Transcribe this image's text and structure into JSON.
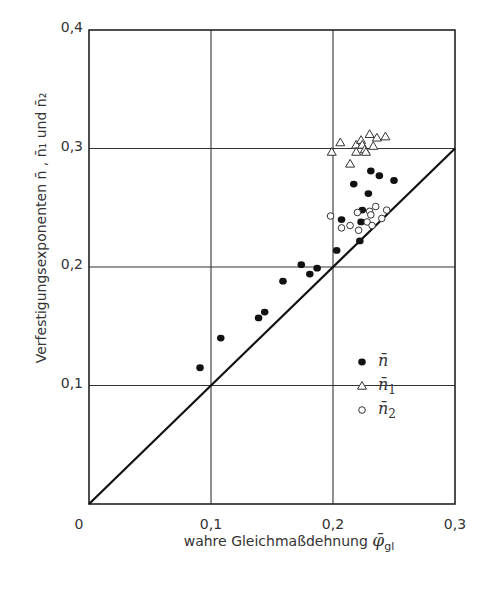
{
  "chart_data": {
    "type": "scatter",
    "title": "",
    "xlabel": "wahre Gleichmaßdehnung φ̄gl",
    "xlabel_main": "wahre Gleichmaßdehnung ",
    "xlabel_symbol": "φ̄",
    "xlabel_sub": "gl",
    "ylabel": "Verfestigungsexponenten n̄ , n̄₁ und n̄₂",
    "xlim": [
      0,
      0.3
    ],
    "ylim": [
      0,
      0.4
    ],
    "grid": true,
    "x_ticks": [
      "0",
      "0,1",
      "0,2",
      "0,3"
    ],
    "x_tick_values": [
      0,
      0.1,
      0.2,
      0.3
    ],
    "y_ticks": [
      "0,1",
      "0,2",
      "0,3",
      "0,4"
    ],
    "y_tick_values": [
      0.1,
      0.2,
      0.3,
      0.4
    ],
    "reference_line": {
      "label": "y = x",
      "from": [
        0,
        0
      ],
      "to": [
        0.3,
        0.3
      ]
    },
    "legend_position": "lower right inside",
    "series": [
      {
        "name": "n̄",
        "marker": "filled-circle",
        "points": [
          [
            0.091,
            0.115
          ],
          [
            0.108,
            0.14
          ],
          [
            0.139,
            0.157
          ],
          [
            0.144,
            0.162
          ],
          [
            0.159,
            0.188
          ],
          [
            0.174,
            0.202
          ],
          [
            0.181,
            0.194
          ],
          [
            0.187,
            0.199
          ],
          [
            0.203,
            0.214
          ],
          [
            0.207,
            0.24
          ],
          [
            0.217,
            0.27
          ],
          [
            0.222,
            0.222
          ],
          [
            0.223,
            0.238
          ],
          [
            0.224,
            0.248
          ],
          [
            0.229,
            0.262
          ],
          [
            0.231,
            0.281
          ],
          [
            0.238,
            0.277
          ],
          [
            0.25,
            0.273
          ]
        ]
      },
      {
        "name": "n̄₁",
        "marker": "open-triangle",
        "points": [
          [
            0.199,
            0.297
          ],
          [
            0.206,
            0.305
          ],
          [
            0.214,
            0.287
          ],
          [
            0.219,
            0.303
          ],
          [
            0.219,
            0.297
          ],
          [
            0.223,
            0.307
          ],
          [
            0.224,
            0.303
          ],
          [
            0.226,
            0.299
          ],
          [
            0.227,
            0.297
          ],
          [
            0.23,
            0.312
          ],
          [
            0.233,
            0.302
          ],
          [
            0.236,
            0.309
          ],
          [
            0.243,
            0.31
          ]
        ]
      },
      {
        "name": "n̄₂",
        "marker": "open-circle",
        "points": [
          [
            0.198,
            0.243
          ],
          [
            0.207,
            0.233
          ],
          [
            0.214,
            0.235
          ],
          [
            0.22,
            0.246
          ],
          [
            0.221,
            0.231
          ],
          [
            0.228,
            0.238
          ],
          [
            0.23,
            0.247
          ],
          [
            0.231,
            0.244
          ],
          [
            0.232,
            0.235
          ],
          [
            0.235,
            0.251
          ],
          [
            0.24,
            0.241
          ],
          [
            0.244,
            0.248
          ]
        ]
      }
    ]
  },
  "legend": {
    "items": [
      {
        "label": "n̄",
        "sub": "",
        "marker": "filled-circle"
      },
      {
        "label": "n̄",
        "sub": "1",
        "marker": "open-triangle"
      },
      {
        "label": "n̄",
        "sub": "2",
        "marker": "open-circle"
      }
    ]
  }
}
